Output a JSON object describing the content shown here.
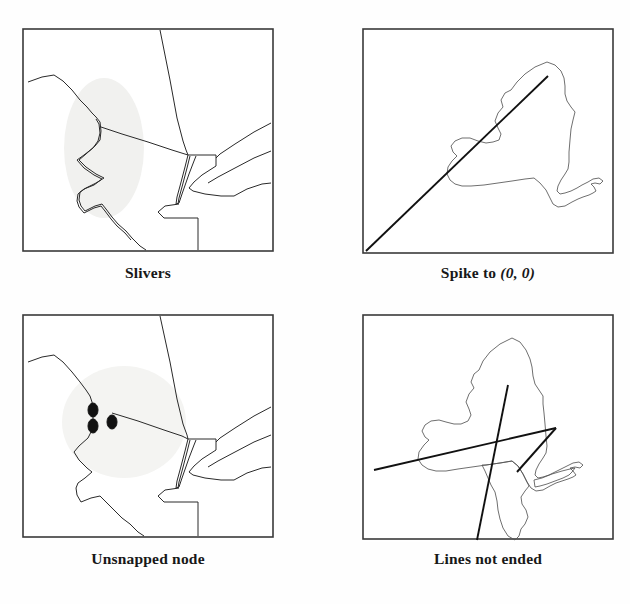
{
  "figure": {
    "title_visible": false,
    "background_color": "#ffffff",
    "panel_count": 4
  },
  "panels": [
    {
      "id": "slivers",
      "caption": "Slivers",
      "caption_parts": {
        "main": "Slivers",
        "italic": ""
      },
      "content_type": "map-boundary-detail",
      "has_highlight_ellipse": true,
      "highlight_color": "#f0f0ee",
      "node_marker_count": 0,
      "frame_color": "#3a3a3a"
    },
    {
      "id": "spike",
      "caption": "Spike to (0, 0)",
      "caption_parts": {
        "main": "Spike to ",
        "italic": "(0, 0)"
      },
      "content_type": "map-state-outline",
      "has_highlight_ellipse": false,
      "highlight_color": "#f0f0ee",
      "node_marker_count": 0,
      "frame_color": "#3a3a3a"
    },
    {
      "id": "unsnapped",
      "caption": "Unsnapped node",
      "caption_parts": {
        "main": "Unsnapped node",
        "italic": ""
      },
      "content_type": "map-boundary-detail",
      "has_highlight_ellipse": true,
      "highlight_color": "#f2f2f0",
      "node_marker_count": 3,
      "frame_color": "#3a3a3a"
    },
    {
      "id": "lines-not-ended",
      "caption": "Lines not ended",
      "caption_parts": {
        "main": "Lines not ended",
        "italic": ""
      },
      "content_type": "map-state-outline-overshoot",
      "has_highlight_ellipse": false,
      "highlight_color": "#f0f0ee",
      "node_marker_count": 0,
      "frame_color": "#3a3a3a"
    }
  ],
  "colors": {
    "ink": "#2a2a2a",
    "ink_light": "#555555",
    "ink_heavy": "#111111",
    "frame": "#3a3a3a",
    "highlight": "#f0f0ee",
    "paper": "#ffffff"
  }
}
